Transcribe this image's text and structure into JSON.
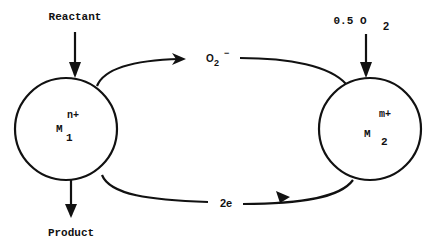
{
  "diagram": {
    "type": "redox-cycle",
    "colors": {
      "stroke": "#111111",
      "background": "#ffffff"
    },
    "inputs": {
      "reactant": "Reactant",
      "oxygen_coef": "0.5 O",
      "oxygen_sub": "2"
    },
    "outputs": {
      "product": "Product"
    },
    "metal_1": {
      "symbol": "M",
      "subscript": "1",
      "charge": "n+"
    },
    "metal_2": {
      "symbol": "M",
      "subscript": "2",
      "charge": "m+"
    },
    "top_flow": {
      "species": "O",
      "subscript": "2",
      "charge": "−",
      "direction": "right-to-left"
    },
    "bottom_flow": {
      "label": "2e",
      "direction": "left-to-right"
    }
  }
}
